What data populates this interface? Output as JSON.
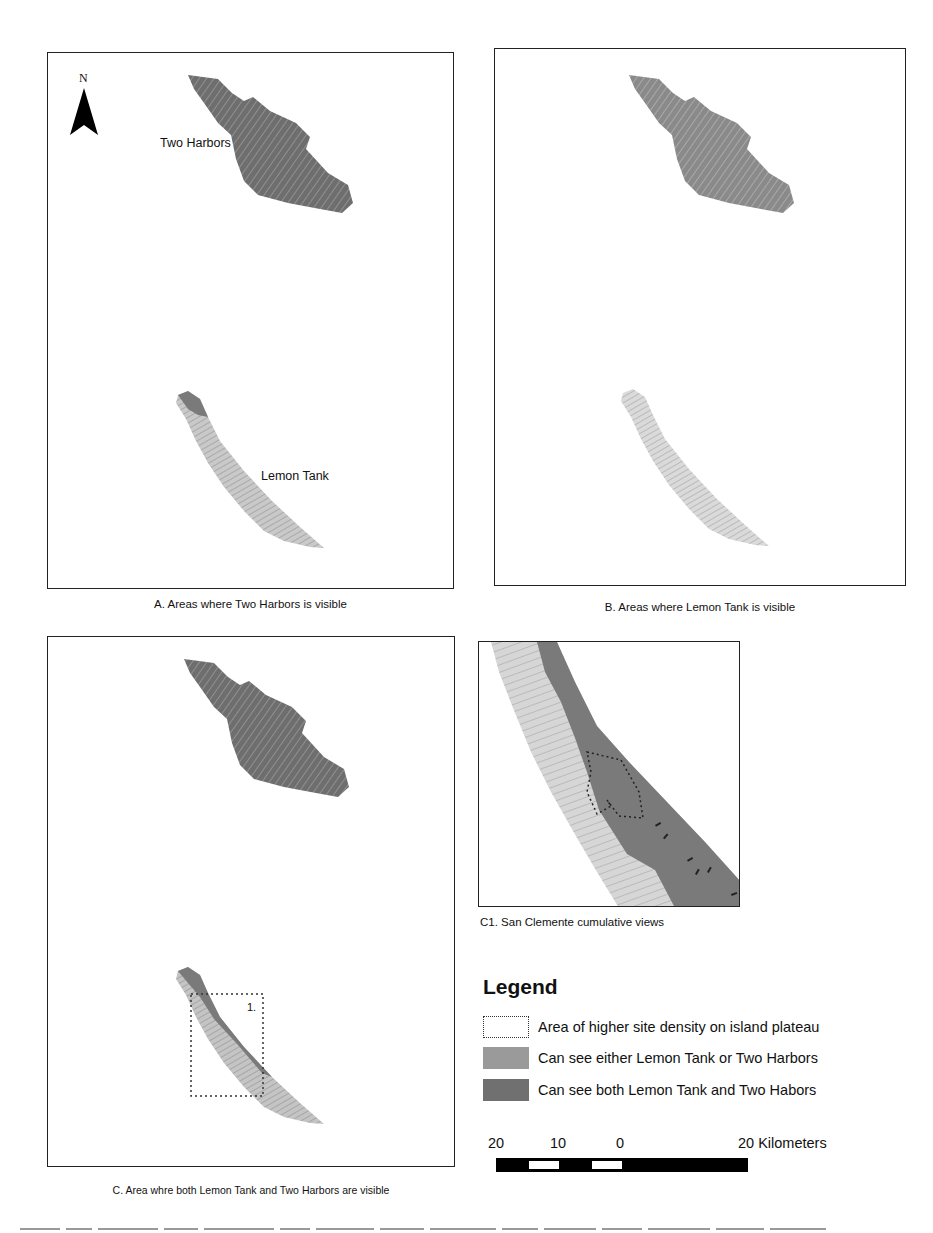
{
  "figure": {
    "panels": [
      {
        "id": "A",
        "caption": "A. Areas where Two Harbors is visible",
        "labels": {
          "north": "N",
          "upper_island": "Two Harbors",
          "lower_island": "Lemon Tank"
        }
      },
      {
        "id": "B",
        "caption": "B. Areas where Lemon Tank is visible"
      },
      {
        "id": "C",
        "caption": "C. Area whre both Lemon Tank and Two Harbors are visible",
        "labels": {
          "inset_marker": "1."
        }
      },
      {
        "id": "C1",
        "caption": "C1. San Clemente cumulative views"
      }
    ],
    "legend": {
      "title": "Legend",
      "items": [
        {
          "symbol": "dotted-outline",
          "label": "Area of higher site density on island plateau"
        },
        {
          "symbol": "fill",
          "color": "#9a9a9a",
          "label": "Can see either Lemon Tank or Two Harbors"
        },
        {
          "symbol": "fill",
          "color": "#707070",
          "label": "Can see both Lemon Tank and Two Habors"
        }
      ]
    },
    "scale_bar": {
      "ticks": [
        "20",
        "10",
        "0",
        "20 Kilometers"
      ],
      "unit": "Kilometers"
    },
    "colors": {
      "frame": "#222222",
      "island_dark": "#6e6e6e",
      "island_mid": "#9a9a9a",
      "island_light": "#d4d4d4",
      "north_arrow": "#000000"
    }
  }
}
